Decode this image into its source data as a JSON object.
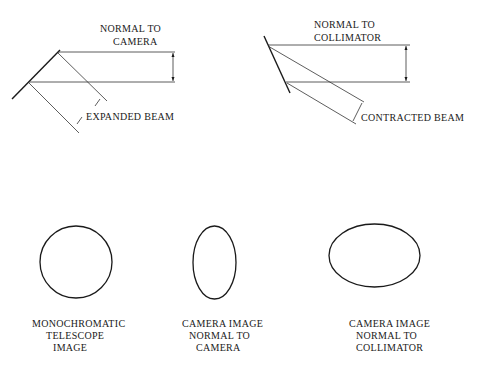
{
  "colors": {
    "ink": "#1a1a1a",
    "background": "#ffffff"
  },
  "top_left_figure": {
    "normal_label_line1": "NORMAL TO",
    "normal_label_line2": "CAMERA",
    "beam_label": "EXPANDED BEAM"
  },
  "top_right_figure": {
    "normal_label_line1": "NORMAL TO",
    "normal_label_line2": "COLLIMATOR",
    "beam_label": "CONTRACTED BEAM"
  },
  "images": [
    {
      "shape": "circle",
      "label_lines": [
        "MONOCHROMATIC",
        "TELESCOPE",
        "IMAGE"
      ]
    },
    {
      "shape": "tall-ellipse",
      "label_lines": [
        "CAMERA IMAGE",
        "NORMAL TO",
        "CAMERA"
      ]
    },
    {
      "shape": "wide-ellipse",
      "label_lines": [
        "CAMERA IMAGE",
        "NORMAL TO",
        "COLLIMATOR"
      ]
    }
  ]
}
